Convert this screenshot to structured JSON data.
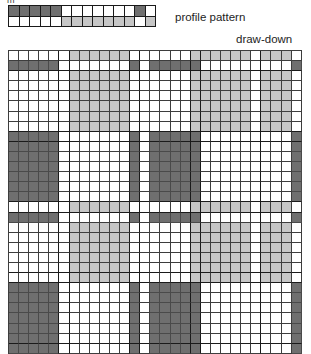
{
  "figure": {
    "type": "weaving-draft",
    "clipped_text": "m",
    "profile_label": "profile pattern",
    "drawdown_label": "draw-down"
  },
  "colors": {
    "dark": "#6f6f6f",
    "mid": "#9d9d9d",
    "light": "#c6c6c6",
    "white": "#ffffff",
    "grid_line": "#3d3d3d",
    "block_line": "#1a1a1a",
    "text": "#1d1d1d"
  },
  "profile_pattern": {
    "rows": 2,
    "cols": 14,
    "cell_px": 10.5,
    "legend": {
      "0": "white",
      "1": "dark",
      "2": "light"
    },
    "cells": [
      [
        1,
        1,
        1,
        1,
        1,
        0,
        0,
        0,
        0,
        0,
        0,
        0,
        1,
        0
      ],
      [
        0,
        0,
        0,
        0,
        0,
        2,
        2,
        2,
        2,
        2,
        2,
        2,
        0,
        2
      ]
    ]
  },
  "drawdown": {
    "rows": 30,
    "cols": 29,
    "cell_px": 10.1,
    "legend": {
      "0": "white",
      "1": "dark",
      "2": "light"
    },
    "col_block_edges": [
      4,
      5,
      11,
      12,
      17,
      18,
      24
    ],
    "row_block_edges": [
      1,
      7,
      8,
      14,
      15,
      21,
      22,
      28
    ],
    "cells": [
      [
        0,
        0,
        0,
        0,
        0,
        0,
        2,
        2,
        2,
        2,
        2,
        2,
        0,
        0,
        0,
        0,
        0,
        0,
        2,
        2,
        2,
        2,
        2,
        2,
        0,
        2,
        2,
        2,
        0
      ],
      [
        1,
        1,
        1,
        1,
        1,
        0,
        0,
        0,
        0,
        0,
        0,
        0,
        1,
        0,
        1,
        1,
        1,
        1,
        1,
        0,
        0,
        0,
        0,
        0,
        0,
        0,
        0,
        0,
        1
      ],
      [
        0,
        0,
        0,
        0,
        0,
        0,
        2,
        2,
        2,
        2,
        2,
        2,
        0,
        0,
        0,
        0,
        0,
        0,
        2,
        2,
        2,
        2,
        2,
        2,
        0,
        2,
        2,
        2,
        0
      ],
      [
        0,
        0,
        0,
        0,
        0,
        0,
        2,
        2,
        2,
        2,
        2,
        2,
        0,
        0,
        0,
        0,
        0,
        0,
        2,
        2,
        2,
        2,
        2,
        2,
        0,
        2,
        2,
        2,
        0
      ],
      [
        0,
        0,
        0,
        0,
        0,
        0,
        2,
        2,
        2,
        2,
        2,
        2,
        0,
        0,
        0,
        0,
        0,
        0,
        2,
        2,
        2,
        2,
        2,
        2,
        0,
        2,
        2,
        2,
        0
      ],
      [
        0,
        0,
        0,
        0,
        0,
        0,
        2,
        2,
        2,
        2,
        2,
        2,
        0,
        0,
        0,
        0,
        0,
        0,
        2,
        2,
        2,
        2,
        2,
        2,
        0,
        2,
        2,
        2,
        0
      ],
      [
        0,
        0,
        0,
        0,
        0,
        0,
        2,
        2,
        2,
        2,
        2,
        2,
        0,
        0,
        0,
        0,
        0,
        0,
        2,
        2,
        2,
        2,
        2,
        2,
        0,
        2,
        2,
        2,
        0
      ],
      [
        0,
        0,
        0,
        0,
        0,
        0,
        2,
        2,
        2,
        2,
        2,
        2,
        0,
        0,
        0,
        0,
        0,
        0,
        2,
        2,
        2,
        2,
        2,
        2,
        0,
        2,
        2,
        2,
        0
      ],
      [
        1,
        1,
        1,
        1,
        1,
        0,
        0,
        0,
        0,
        0,
        0,
        0,
        1,
        0,
        1,
        1,
        1,
        1,
        1,
        0,
        0,
        0,
        0,
        0,
        0,
        0,
        0,
        0,
        1
      ],
      [
        1,
        1,
        1,
        1,
        1,
        0,
        0,
        0,
        0,
        0,
        0,
        0,
        1,
        0,
        1,
        1,
        1,
        1,
        1,
        0,
        0,
        0,
        0,
        0,
        0,
        0,
        0,
        0,
        1
      ],
      [
        1,
        1,
        1,
        1,
        1,
        0,
        0,
        0,
        0,
        0,
        0,
        0,
        1,
        0,
        1,
        1,
        1,
        1,
        1,
        0,
        0,
        0,
        0,
        0,
        0,
        0,
        0,
        0,
        1
      ],
      [
        1,
        1,
        1,
        1,
        1,
        0,
        0,
        0,
        0,
        0,
        0,
        0,
        1,
        0,
        1,
        1,
        1,
        1,
        1,
        0,
        0,
        0,
        0,
        0,
        0,
        0,
        0,
        0,
        1
      ],
      [
        1,
        1,
        1,
        1,
        1,
        0,
        0,
        0,
        0,
        0,
        0,
        0,
        1,
        0,
        1,
        1,
        1,
        1,
        1,
        0,
        0,
        0,
        0,
        0,
        0,
        0,
        0,
        0,
        1
      ],
      [
        1,
        1,
        1,
        1,
        1,
        0,
        0,
        0,
        0,
        0,
        0,
        0,
        1,
        0,
        1,
        1,
        1,
        1,
        1,
        0,
        0,
        0,
        0,
        0,
        0,
        0,
        0,
        0,
        1
      ],
      [
        1,
        1,
        1,
        1,
        1,
        0,
        0,
        0,
        0,
        0,
        0,
        0,
        1,
        0,
        1,
        1,
        1,
        1,
        1,
        0,
        0,
        0,
        0,
        0,
        0,
        0,
        0,
        0,
        1
      ],
      [
        0,
        0,
        0,
        0,
        0,
        0,
        2,
        2,
        2,
        2,
        2,
        2,
        0,
        0,
        0,
        0,
        0,
        0,
        2,
        2,
        2,
        2,
        2,
        2,
        0,
        2,
        2,
        2,
        0
      ],
      [
        1,
        1,
        1,
        1,
        1,
        0,
        0,
        0,
        0,
        0,
        0,
        0,
        1,
        0,
        1,
        1,
        1,
        1,
        1,
        0,
        0,
        0,
        0,
        0,
        0,
        0,
        0,
        0,
        1
      ],
      [
        0,
        0,
        0,
        0,
        0,
        0,
        2,
        2,
        2,
        2,
        2,
        2,
        0,
        0,
        0,
        0,
        0,
        0,
        2,
        2,
        2,
        2,
        2,
        2,
        0,
        2,
        2,
        2,
        0
      ],
      [
        0,
        0,
        0,
        0,
        0,
        0,
        2,
        2,
        2,
        2,
        2,
        2,
        0,
        0,
        0,
        0,
        0,
        0,
        2,
        2,
        2,
        2,
        2,
        2,
        0,
        2,
        2,
        2,
        0
      ],
      [
        0,
        0,
        0,
        0,
        0,
        0,
        2,
        2,
        2,
        2,
        2,
        2,
        0,
        0,
        0,
        0,
        0,
        0,
        2,
        2,
        2,
        2,
        2,
        2,
        0,
        2,
        2,
        2,
        0
      ],
      [
        0,
        0,
        0,
        0,
        0,
        0,
        2,
        2,
        2,
        2,
        2,
        2,
        0,
        0,
        0,
        0,
        0,
        0,
        2,
        2,
        2,
        2,
        2,
        2,
        0,
        2,
        2,
        2,
        0
      ],
      [
        0,
        0,
        0,
        0,
        0,
        0,
        2,
        2,
        2,
        2,
        2,
        2,
        0,
        0,
        0,
        0,
        0,
        0,
        2,
        2,
        2,
        2,
        2,
        2,
        0,
        2,
        2,
        2,
        0
      ],
      [
        0,
        0,
        0,
        0,
        0,
        0,
        2,
        2,
        2,
        2,
        2,
        2,
        0,
        0,
        0,
        0,
        0,
        0,
        2,
        2,
        2,
        2,
        2,
        2,
        0,
        2,
        2,
        2,
        0
      ],
      [
        1,
        1,
        1,
        1,
        1,
        0,
        0,
        0,
        0,
        0,
        0,
        0,
        1,
        0,
        1,
        1,
        1,
        1,
        1,
        0,
        0,
        0,
        0,
        0,
        0,
        0,
        0,
        0,
        1
      ],
      [
        1,
        1,
        1,
        1,
        1,
        0,
        0,
        0,
        0,
        0,
        0,
        0,
        1,
        0,
        1,
        1,
        1,
        1,
        1,
        0,
        0,
        0,
        0,
        0,
        0,
        0,
        0,
        0,
        1
      ],
      [
        1,
        1,
        1,
        1,
        1,
        0,
        0,
        0,
        0,
        0,
        0,
        0,
        1,
        0,
        1,
        1,
        1,
        1,
        1,
        0,
        0,
        0,
        0,
        0,
        0,
        0,
        0,
        0,
        1
      ],
      [
        1,
        1,
        1,
        1,
        1,
        0,
        0,
        0,
        0,
        0,
        0,
        0,
        1,
        0,
        1,
        1,
        1,
        1,
        1,
        0,
        0,
        0,
        0,
        0,
        0,
        0,
        0,
        0,
        1
      ],
      [
        1,
        1,
        1,
        1,
        1,
        0,
        0,
        0,
        0,
        0,
        0,
        0,
        1,
        0,
        1,
        1,
        1,
        1,
        1,
        0,
        0,
        0,
        0,
        0,
        0,
        0,
        0,
        0,
        1
      ],
      [
        1,
        1,
        1,
        1,
        1,
        0,
        0,
        0,
        0,
        0,
        0,
        0,
        1,
        0,
        1,
        1,
        1,
        1,
        1,
        0,
        0,
        0,
        0,
        0,
        0,
        0,
        0,
        0,
        1
      ],
      [
        1,
        1,
        1,
        1,
        1,
        0,
        0,
        0,
        0,
        0,
        0,
        0,
        1,
        0,
        1,
        1,
        1,
        1,
        1,
        0,
        0,
        0,
        0,
        0,
        0,
        0,
        0,
        0,
        1
      ]
    ]
  }
}
